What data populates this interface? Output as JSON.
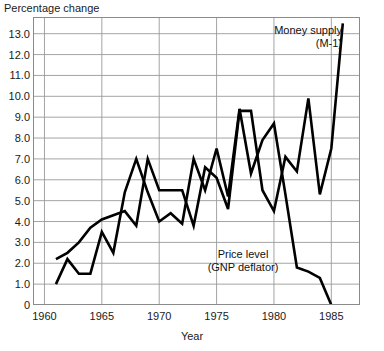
{
  "chart_data": {
    "type": "line",
    "title": "",
    "ylabel": "Percentage change",
    "xlabel": "Year",
    "ylim": [
      0,
      13.8
    ],
    "xlim": [
      1959.0,
      1987.5
    ],
    "yticks": [
      0,
      1.0,
      2.0,
      3.0,
      4.0,
      5.0,
      6.0,
      7.0,
      8.0,
      9.0,
      10.0,
      11.0,
      12.0,
      13.0
    ],
    "ytick_labels": [
      "0",
      "1.0",
      "2.0",
      "3.0",
      "4.0",
      "5.0",
      "6.0",
      "7.0",
      "8.0",
      "9.0",
      "10.0",
      "11.0",
      "12.0",
      "13.0"
    ],
    "xticks": [
      1960,
      1965,
      1970,
      1975,
      1980,
      1985
    ],
    "xtick_labels": [
      "1960",
      "1965",
      "1970",
      "1975",
      "1980",
      "1985"
    ],
    "grid": true,
    "legend_position": "inline-annotations",
    "series": [
      {
        "name": "Money supply (M-1)",
        "label_line1": "Money supply",
        "label_line2": "(M-1)",
        "color": "#000000",
        "x": [
          1961,
          1962,
          1963,
          1964,
          1965,
          1966,
          1967,
          1968,
          1969,
          1970,
          1971,
          1972,
          1973,
          1974,
          1975,
          1976,
          1977,
          1978,
          1979,
          1980,
          1981,
          1982,
          1983,
          1984,
          1985,
          1986
        ],
        "values": [
          2.2,
          2.5,
          3.0,
          3.7,
          4.1,
          4.3,
          4.5,
          3.8,
          7.0,
          5.5,
          5.5,
          5.5,
          3.8,
          6.6,
          6.1,
          4.6,
          9.3,
          9.3,
          5.5,
          4.5,
          7.1,
          6.4,
          9.9,
          5.3,
          7.5,
          13.5
        ]
      },
      {
        "name": "Price level (GNP deflator)",
        "label_line1": "Price level",
        "label_line2": "(GNP deflator)",
        "color": "#000000",
        "x": [
          1961,
          1962,
          1963,
          1964,
          1965,
          1966,
          1967,
          1968,
          1969,
          1970,
          1971,
          1972,
          1973,
          1974,
          1975,
          1976,
          1977,
          1978,
          1979,
          1980,
          1981,
          1982,
          1983,
          1984,
          1985,
          1986
        ],
        "values": [
          1.0,
          2.2,
          1.5,
          1.5,
          3.5,
          2.5,
          5.4,
          7.0,
          5.4,
          4.0,
          4.4,
          3.9,
          7.0,
          5.5,
          7.5,
          5.2,
          9.4,
          6.3,
          7.9,
          8.7,
          5.3,
          1.8,
          1.6,
          1.3,
          0.0,
          -0.5
        ]
      }
    ]
  }
}
